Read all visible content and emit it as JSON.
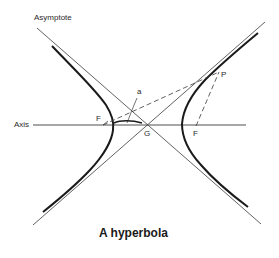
{
  "diagram": {
    "title": "A hyperbola",
    "labels": {
      "asymptote": "Asymptote",
      "axis": "Axis",
      "focus_left": "F",
      "focus_right": "F",
      "center": "G",
      "point_p": "P",
      "point_a": "a"
    },
    "colors": {
      "curve": "#1a1a1a",
      "lines": "#3a3a3a",
      "text": "#2a2a2a",
      "background": "#ffffff"
    },
    "elements": [
      {
        "type": "hyperbola-branch",
        "side": "left"
      },
      {
        "type": "hyperbola-branch",
        "side": "right"
      },
      {
        "type": "asymptote",
        "count": 2
      },
      {
        "type": "axis",
        "label": "Axis"
      },
      {
        "type": "dashed-line",
        "from": "F (left)",
        "to": "P"
      },
      {
        "type": "dashed-line",
        "from": "F (right)",
        "to": "P"
      }
    ]
  }
}
